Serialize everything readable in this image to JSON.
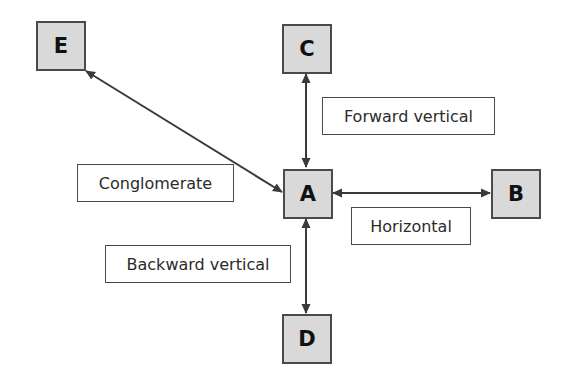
{
  "diagram": {
    "type": "integration-types",
    "colors": {
      "node_fill": "#d9d9d9",
      "node_border": "#4a4a4a",
      "arrow": "#3a3a3a",
      "label_border": "#4a4a4a",
      "text": "#2b2b2b"
    },
    "nodes": {
      "a": "A",
      "b": "B",
      "c": "C",
      "d": "D",
      "e": "E"
    },
    "labels": {
      "forward_vertical": "Forward vertical",
      "conglomerate": "Conglomerate",
      "horizontal": "Horizontal",
      "backward_vertical": "Backward vertical"
    },
    "edges": [
      {
        "from": "A",
        "to": "C",
        "type": "Forward vertical",
        "bidirectional": true
      },
      {
        "from": "A",
        "to": "B",
        "type": "Horizontal",
        "bidirectional": true
      },
      {
        "from": "A",
        "to": "D",
        "type": "Backward vertical",
        "bidirectional": true
      },
      {
        "from": "A",
        "to": "E",
        "type": "Conglomerate",
        "bidirectional": true
      }
    ]
  }
}
